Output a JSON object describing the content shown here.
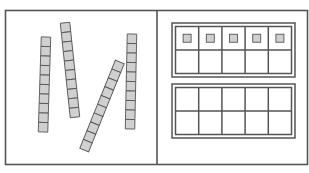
{
  "diagram": {
    "colors": {
      "border": "#555555",
      "cube_fill": "#d0d0d0",
      "cube_stroke": "#555555",
      "background": "#ffffff"
    },
    "left_panel": {
      "label": "ten-rods",
      "rods": [
        {
          "id": "rod-1",
          "cubes": 10,
          "cx": 44.5,
          "cy": 84.5,
          "angle": 1.8
        },
        {
          "id": "rod-2",
          "cubes": 10,
          "cx": 70,
          "cy": 70,
          "angle": -6
        },
        {
          "id": "rod-3",
          "cubes": 10,
          "cx": 102,
          "cy": 106,
          "angle": 22
        },
        {
          "id": "rod-4",
          "cubes": 10,
          "cx": 131,
          "cy": 81.5,
          "angle": 1.2
        }
      ]
    },
    "right_panel": {
      "label": "ten-frames",
      "frames": [
        {
          "id": "ten-frame-1",
          "rows": 2,
          "cols": 5,
          "filled_cells": [
            0,
            1,
            2,
            3,
            4
          ]
        },
        {
          "id": "ten-frame-2",
          "rows": 2,
          "cols": 5,
          "filled_cells": []
        }
      ]
    }
  }
}
